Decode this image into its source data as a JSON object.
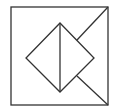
{
  "diagram": {
    "width": 116,
    "height": 111,
    "stroke_color": "#333333",
    "background": "#ffffff",
    "square": {
      "x1": 11,
      "y1": 7,
      "x2": 108,
      "y2": 105
    },
    "diamond": {
      "top": [
        60,
        23
      ],
      "right": [
        94,
        58
      ],
      "bottom": [
        60,
        92
      ],
      "left": [
        26,
        58
      ]
    },
    "vertical_diagonal": {
      "from": [
        60,
        23
      ],
      "to": [
        60,
        92
      ]
    },
    "corner_lines": [
      {
        "from": [
          108,
          7
        ],
        "to": [
          77,
          40
        ]
      },
      {
        "from": [
          108,
          105
        ],
        "to": [
          77,
          76
        ]
      }
    ]
  }
}
